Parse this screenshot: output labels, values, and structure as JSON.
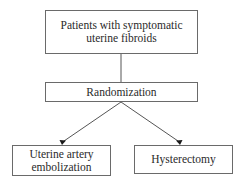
{
  "diagram": {
    "type": "flowchart",
    "nodes": {
      "patients": {
        "line1": "Patients with symptomatic",
        "line2": "uterine fibroids"
      },
      "randomization": {
        "label": "Randomization"
      },
      "uae": {
        "line1": "Uterine artery",
        "line2": "embolization"
      },
      "hysterectomy": {
        "label": "Hysterectomy"
      }
    },
    "edges": [
      {
        "from": "patients",
        "to": "randomization",
        "style": "line"
      },
      {
        "from": "randomization",
        "to": "uae",
        "style": "arrow"
      },
      {
        "from": "randomization",
        "to": "hysterectomy",
        "style": "arrow"
      }
    ],
    "colors": {
      "border": "#6a6a6a",
      "line": "#555555",
      "text": "#2a2a2a",
      "background": "#ffffff"
    }
  }
}
